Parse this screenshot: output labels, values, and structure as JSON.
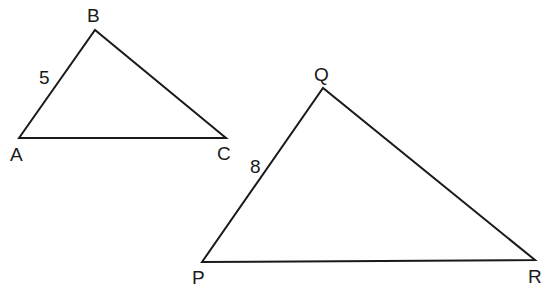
{
  "diagram": {
    "type": "similar-triangles",
    "triangles": [
      {
        "name": "ABC",
        "vertices": {
          "A": {
            "label": "A",
            "x": 19,
            "y": 138,
            "lx": 10,
            "ly": 161
          },
          "B": {
            "label": "B",
            "x": 95,
            "y": 30,
            "lx": 87,
            "ly": 22
          },
          "C": {
            "label": "C",
            "x": 226,
            "y": 138,
            "lx": 217,
            "ly": 160
          }
        },
        "side_labels": [
          {
            "side": "AB",
            "text": "5",
            "x": 39,
            "y": 84
          }
        ]
      },
      {
        "name": "PQR",
        "vertices": {
          "P": {
            "label": "P",
            "x": 202,
            "y": 262,
            "lx": 192,
            "ly": 284
          },
          "Q": {
            "label": "Q",
            "x": 323,
            "y": 88,
            "lx": 314,
            "ly": 81
          },
          "R": {
            "label": "R",
            "x": 535,
            "y": 260,
            "lx": 528,
            "ly": 283
          }
        },
        "side_labels": [
          {
            "side": "PQ",
            "text": "8",
            "x": 250,
            "y": 173
          }
        ]
      }
    ]
  }
}
